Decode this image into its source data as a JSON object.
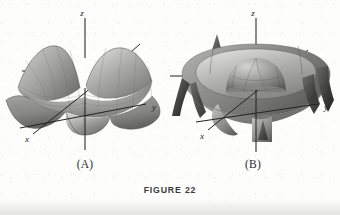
{
  "figure": {
    "caption": "FIGURE 22",
    "background_color": "#fdfdfc",
    "ink_color": "#232323"
  },
  "panels": [
    {
      "id": "A",
      "label": "(A)",
      "surface_name": "egg-crate-saddle-surface",
      "description": "Oscillating egg-crate surface with four raised corner peaks and intervening valleys, shaded gray",
      "axes": [
        {
          "name": "x",
          "label": "x"
        },
        {
          "name": "y",
          "label": "y"
        },
        {
          "name": "z",
          "label": "z"
        }
      ],
      "shading": {
        "highlight": "#d9d9d7",
        "midtone": "#a6a6a4",
        "shadow": "#5e5e5c"
      }
    },
    {
      "id": "B",
      "label": "(B)",
      "surface_name": "crater-dome-surface",
      "description": "Bowl-shaped crater rim surrounding an inner hemispherical dome, with sharp spiked lobes at the outer edge",
      "axes": [
        {
          "name": "x",
          "label": "x"
        },
        {
          "name": "y",
          "label": "y"
        },
        {
          "name": "z",
          "label": "z"
        }
      ],
      "shading": {
        "highlight": "#dcdcda",
        "midtone": "#9e9e9c",
        "shadow": "#4c4c4a"
      }
    }
  ]
}
